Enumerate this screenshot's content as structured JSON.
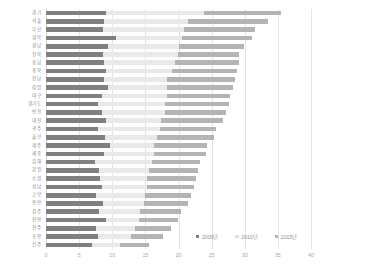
{
  "chart_data": {
    "type": "bar",
    "orientation": "horizontal",
    "stacked": true,
    "title": "",
    "xlabel": "",
    "ylabel": "",
    "xlim": [
      0,
      40
    ],
    "xticks": [
      0,
      5,
      10,
      15,
      20,
      25,
      30,
      35,
      40
    ],
    "xticklabels": [
      "0",
      "5",
      "10",
      "15",
      "20",
      "25",
      "30",
      "35",
      "40"
    ],
    "grid": true,
    "grid_axis": "x",
    "legend_position": "bottom-right",
    "legend": [
      "2000년",
      "2010년",
      "2015년"
    ],
    "colors": [
      "#808080",
      "#e9e9e9",
      "#b4b4b4"
    ],
    "categories": [
      "경기",
      "서울",
      "부산",
      "경북",
      "경남",
      "전북",
      "충남",
      "충북",
      "전남",
      "강원",
      "대구",
      "경기도",
      "인천",
      "대전",
      "광주",
      "울산",
      "제주",
      "세종",
      "김해",
      "창원",
      "수원",
      "성남",
      "고양",
      "용인",
      "청주",
      "천안",
      "전주",
      "포항",
      "진주"
    ],
    "series": [
      {
        "name": "2000년",
        "values": [
          9.1,
          8.8,
          8.6,
          10.5,
          9.4,
          8.6,
          8.7,
          9.0,
          8.8,
          9.3,
          8.5,
          7.9,
          8.4,
          9.0,
          7.8,
          8.9,
          9.7,
          8.7,
          7.4,
          8.0,
          8.2,
          8.4,
          7.6,
          8.6,
          8.0,
          9.0,
          7.5,
          7.8,
          6.9
        ]
      },
      {
        "name": "2010년",
        "values": [
          14.7,
          12.6,
          12.2,
          10.0,
          10.7,
          11.3,
          10.8,
          10.0,
          9.5,
          8.9,
          9.8,
          10.1,
          9.5,
          8.4,
          9.4,
          7.9,
          6.6,
          7.6,
          8.6,
          7.5,
          7.0,
          6.8,
          7.4,
          6.2,
          6.2,
          5.0,
          6.0,
          5.1,
          4.2
        ]
      },
      {
        "name": "2015년",
        "values": [
          11.7,
          12.1,
          10.7,
          10.6,
          9.8,
          9.3,
          9.6,
          9.9,
          10.3,
          10.1,
          9.4,
          9.6,
          9.2,
          9.3,
          8.5,
          8.6,
          8.0,
          7.8,
          7.3,
          7.4,
          7.4,
          7.1,
          6.9,
          6.6,
          6.2,
          5.9,
          5.4,
          4.8,
          4.4
        ]
      }
    ],
    "totals": [
      35.5,
      33.5,
      31.5,
      31.1,
      29.9,
      29.2,
      29.1,
      28.9,
      28.6,
      28.3,
      27.7,
      27.6,
      27.1,
      26.7,
      25.7,
      25.4,
      24.3,
      24.1,
      23.3,
      22.9,
      22.6,
      22.3,
      21.9,
      21.4,
      20.4,
      19.9,
      18.9,
      17.7,
      15.5
    ]
  }
}
